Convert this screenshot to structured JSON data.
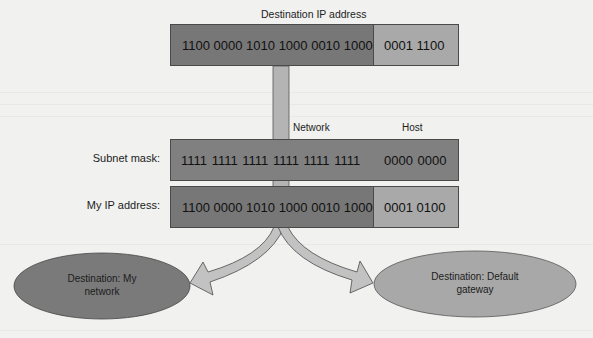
{
  "diagram": {
    "title": "Destination IP address",
    "destination_ip": {
      "network": "1100 0000 1010 1000 0010 1000",
      "host": "0001 1100"
    },
    "column_labels": {
      "network": "Network",
      "host": "Host"
    },
    "subnet_mask": {
      "label": "Subnet mask:",
      "network": "1111 1111 1111 1111 1111 1111",
      "host": "0000 0000"
    },
    "my_ip": {
      "label": "My IP address:",
      "network": "1100 0000 1010 1000 0010 1000",
      "host": "0001 0100"
    },
    "outcomes": {
      "left": {
        "line1": "Destination: My",
        "line2": "network"
      },
      "right": {
        "line1": "Destination: Default",
        "line2": "gateway"
      }
    },
    "colors": {
      "network_segment": "#777777",
      "host_segment": "#a9a9a9",
      "mask_box": "#808080",
      "connector": "#b4b4b4",
      "arrow_fill": "#c2c2c2",
      "left_ellipse": "#7a7a7a",
      "right_ellipse": "#a8a8a8",
      "background": "#f1f1ef"
    }
  }
}
